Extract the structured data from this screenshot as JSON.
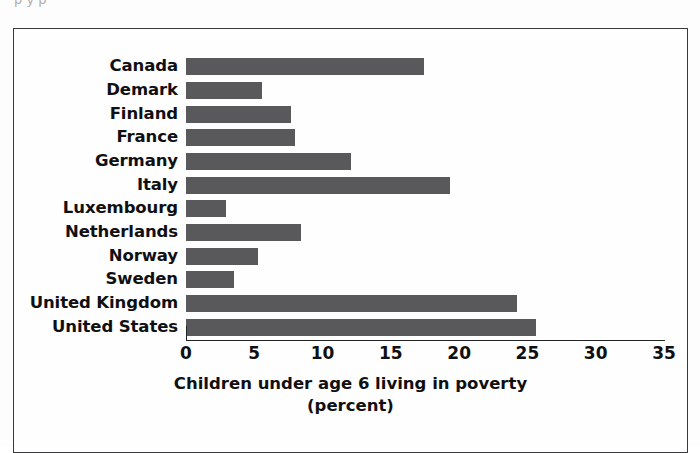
{
  "scan": {
    "top_sliver_text": "p y p"
  },
  "chart_data": {
    "type": "bar",
    "orientation": "horizontal",
    "title": "",
    "xlabel": "Children under age 6 living in poverty",
    "xlabel_line2": "(percent)",
    "ylabel": "",
    "xlim": [
      0,
      35
    ],
    "xticks": [
      0,
      5,
      10,
      15,
      20,
      25,
      30,
      35
    ],
    "grid": false,
    "legend": false,
    "bar_color": "#59595b",
    "categories": [
      "Canada",
      "Demark",
      "Finland",
      "France",
      "Germany",
      "Italy",
      "Luxembourg",
      "Netherlands",
      "Norway",
      "Sweden",
      "United Kingdom",
      "United States"
    ],
    "values": [
      17.4,
      5.6,
      7.7,
      8.0,
      12.1,
      19.3,
      2.9,
      8.4,
      5.3,
      3.5,
      24.2,
      25.6
    ]
  }
}
